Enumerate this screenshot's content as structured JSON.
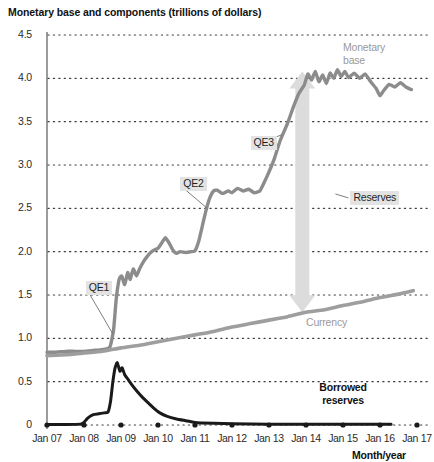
{
  "chart_data": {
    "type": "line",
    "title": "Monetary base and components (trillions of dollars)",
    "xlabel": "Month/year",
    "ylabel": "",
    "ylim": [
      0,
      4.5
    ],
    "ytick_labels": [
      "0",
      "0.5",
      "1.0",
      "1.5",
      "2.0",
      "2.5",
      "3.0",
      "3.5",
      "4.0",
      "4.5"
    ],
    "ytick_values": [
      0,
      0.5,
      1.0,
      1.5,
      2.0,
      2.5,
      3.0,
      3.5,
      4.0,
      4.5
    ],
    "xtick_labels": [
      "Jan 07",
      "Jan 08",
      "Jan 09",
      "Jan 10",
      "Jan 11",
      "Jan 12",
      "Jan 13",
      "Jan 14",
      "Jan 15",
      "Jan 16",
      "Jan 17"
    ],
    "xtick_values": [
      2007,
      2008,
      2009,
      2010,
      2011,
      2012,
      2013,
      2014,
      2015,
      2016,
      2017
    ],
    "grid": "horizontal dotted gridlines at every 0.5",
    "legend_position": "inline annotations on plot",
    "series": [
      {
        "name": "Monetary base",
        "color": "#8c8c8c",
        "points": [
          [
            2007.0,
            0.84
          ],
          [
            2007.25,
            0.84
          ],
          [
            2007.5,
            0.85
          ],
          [
            2007.75,
            0.85
          ],
          [
            2008.0,
            0.85
          ],
          [
            2008.25,
            0.86
          ],
          [
            2008.5,
            0.87
          ],
          [
            2008.7,
            0.9
          ],
          [
            2008.8,
            1.1
          ],
          [
            2008.87,
            1.45
          ],
          [
            2008.95,
            1.68
          ],
          [
            2009.02,
            1.72
          ],
          [
            2009.1,
            1.62
          ],
          [
            2009.18,
            1.76
          ],
          [
            2009.25,
            1.68
          ],
          [
            2009.33,
            1.8
          ],
          [
            2009.42,
            1.72
          ],
          [
            2009.5,
            1.8
          ],
          [
            2009.6,
            1.88
          ],
          [
            2009.7,
            1.94
          ],
          [
            2009.8,
            1.99
          ],
          [
            2009.9,
            2.02
          ],
          [
            2010.0,
            2.04
          ],
          [
            2010.1,
            2.1
          ],
          [
            2010.2,
            2.16
          ],
          [
            2010.3,
            2.1
          ],
          [
            2010.4,
            2.02
          ],
          [
            2010.5,
            1.98
          ],
          [
            2010.6,
            2.0
          ],
          [
            2010.75,
            1.99
          ],
          [
            2010.9,
            2.0
          ],
          [
            2011.0,
            2.01
          ],
          [
            2011.1,
            2.12
          ],
          [
            2011.2,
            2.3
          ],
          [
            2011.3,
            2.48
          ],
          [
            2011.4,
            2.62
          ],
          [
            2011.5,
            2.7
          ],
          [
            2011.6,
            2.71
          ],
          [
            2011.75,
            2.67
          ],
          [
            2011.9,
            2.7
          ],
          [
            2012.0,
            2.68
          ],
          [
            2012.15,
            2.73
          ],
          [
            2012.3,
            2.7
          ],
          [
            2012.45,
            2.72
          ],
          [
            2012.6,
            2.68
          ],
          [
            2012.75,
            2.7
          ],
          [
            2012.85,
            2.78
          ],
          [
            2013.0,
            2.92
          ],
          [
            2013.15,
            3.08
          ],
          [
            2013.3,
            3.28
          ],
          [
            2013.5,
            3.48
          ],
          [
            2013.65,
            3.66
          ],
          [
            2013.8,
            3.82
          ],
          [
            2013.95,
            3.92
          ],
          [
            2014.05,
            4.05
          ],
          [
            2014.15,
            3.98
          ],
          [
            2014.25,
            4.08
          ],
          [
            2014.35,
            3.96
          ],
          [
            2014.45,
            4.04
          ],
          [
            2014.55,
            3.94
          ],
          [
            2014.65,
            4.06
          ],
          [
            2014.75,
            4.0
          ],
          [
            2014.85,
            4.1
          ],
          [
            2014.95,
            4.02
          ],
          [
            2015.05,
            4.08
          ],
          [
            2015.15,
            4.01
          ],
          [
            2015.3,
            4.06
          ],
          [
            2015.45,
            4.0
          ],
          [
            2015.6,
            4.05
          ],
          [
            2015.75,
            3.96
          ],
          [
            2015.9,
            3.88
          ],
          [
            2016.0,
            3.8
          ],
          [
            2016.1,
            3.86
          ],
          [
            2016.25,
            3.93
          ],
          [
            2016.4,
            3.9
          ],
          [
            2016.55,
            3.95
          ],
          [
            2016.7,
            3.9
          ],
          [
            2016.85,
            3.87
          ]
        ]
      },
      {
        "name": "Currency",
        "color": "#9e9e9e",
        "points": [
          [
            2007.0,
            0.8
          ],
          [
            2007.5,
            0.81
          ],
          [
            2008.0,
            0.83
          ],
          [
            2008.5,
            0.85
          ],
          [
            2009.0,
            0.89
          ],
          [
            2009.5,
            0.92
          ],
          [
            2010.0,
            0.96
          ],
          [
            2010.5,
            1.0
          ],
          [
            2011.0,
            1.04
          ],
          [
            2011.5,
            1.08
          ],
          [
            2012.0,
            1.13
          ],
          [
            2012.5,
            1.17
          ],
          [
            2013.0,
            1.21
          ],
          [
            2013.5,
            1.25
          ],
          [
            2014.0,
            1.3
          ],
          [
            2014.5,
            1.33
          ],
          [
            2015.0,
            1.38
          ],
          [
            2015.5,
            1.42
          ],
          [
            2016.0,
            1.47
          ],
          [
            2016.5,
            1.51
          ],
          [
            2016.9,
            1.55
          ]
        ]
      },
      {
        "name": "Borrowed reserves",
        "color": "#1a1a1a",
        "points": [
          [
            2007.0,
            0.005
          ],
          [
            2007.5,
            0.005
          ],
          [
            2007.9,
            0.01
          ],
          [
            2008.0,
            0.03
          ],
          [
            2008.1,
            0.08
          ],
          [
            2008.25,
            0.12
          ],
          [
            2008.4,
            0.13
          ],
          [
            2008.55,
            0.14
          ],
          [
            2008.65,
            0.15
          ],
          [
            2008.72,
            0.28
          ],
          [
            2008.78,
            0.5
          ],
          [
            2008.84,
            0.66
          ],
          [
            2008.9,
            0.72
          ],
          [
            2008.97,
            0.62
          ],
          [
            2009.03,
            0.66
          ],
          [
            2009.1,
            0.58
          ],
          [
            2009.2,
            0.52
          ],
          [
            2009.3,
            0.46
          ],
          [
            2009.45,
            0.38
          ],
          [
            2009.6,
            0.31
          ],
          [
            2009.75,
            0.25
          ],
          [
            2009.9,
            0.19
          ],
          [
            2010.05,
            0.14
          ],
          [
            2010.25,
            0.1
          ],
          [
            2010.5,
            0.07
          ],
          [
            2010.75,
            0.05
          ],
          [
            2011.0,
            0.03
          ],
          [
            2011.5,
            0.02
          ],
          [
            2012.0,
            0.015
          ],
          [
            2013.0,
            0.01
          ],
          [
            2014.0,
            0.01
          ],
          [
            2015.0,
            0.01
          ],
          [
            2016.0,
            0.01
          ],
          [
            2016.3,
            0.01
          ]
        ]
      }
    ],
    "annotations": [
      {
        "name": "qe1",
        "text": "QE1",
        "style": "boxed-callout",
        "x": 2008.05,
        "y": 1.58
      },
      {
        "name": "qe2",
        "text": "QE2",
        "style": "boxed-callout",
        "x": 2010.6,
        "y": 2.78
      },
      {
        "name": "qe3",
        "text": "QE3",
        "style": "boxed-callout",
        "x": 2012.5,
        "y": 3.25
      },
      {
        "name": "reserves",
        "text": "Reserves",
        "style": "boxed-callout",
        "x": 2015.2,
        "y": 2.62
      },
      {
        "name": "monetary-base",
        "text": "Monetary\nbase",
        "style": "gray-label",
        "x": 2015.0,
        "y": 4.35
      },
      {
        "name": "currency",
        "text": "Currency",
        "style": "gray-label",
        "x": 2014.0,
        "y": 1.18
      },
      {
        "name": "borrowed-reserves",
        "text": "Borrowed\nreserves",
        "style": "bold-dark-label",
        "x": 2015.0,
        "y": 0.43
      }
    ],
    "arrow": {
      "name": "reserves-span-arrow",
      "description": "double-headed vertical arrow spanning gap between currency and monetary base",
      "color": "#dcdcdc",
      "x": 2013.9,
      "y_top": 4.08,
      "y_bottom": 1.3
    }
  },
  "labels": {
    "monetary_base_line1": "Monetary",
    "monetary_base_line2": "base",
    "currency": "Currency",
    "borrowed_line1": "Borrowed",
    "borrowed_line2": "reserves",
    "qe1": "QE1",
    "qe2": "QE2",
    "qe3": "QE3",
    "reserves": "Reserves",
    "month_year": "Month/year"
  }
}
